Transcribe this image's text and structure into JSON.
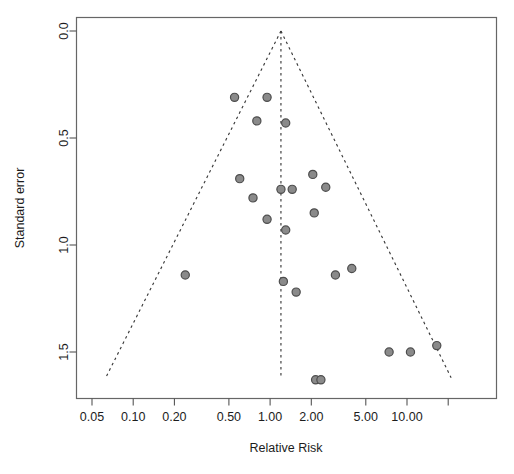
{
  "chart_data": {
    "type": "scatter",
    "title": "",
    "subtitle": "",
    "xlabel": "Relative Risk",
    "ylabel": "Standard error",
    "x_scale": "log",
    "xlim": [
      0.04,
      22.0
    ],
    "ylim": [
      0.0,
      1.62
    ],
    "y_inverted": true,
    "grid": false,
    "legend": "none",
    "x_ticks": [
      {
        "value": 0.05,
        "label": "0.05"
      },
      {
        "value": 0.1,
        "label": "0.10"
      },
      {
        "value": 0.2,
        "label": "0.20"
      },
      {
        "value": 0.5,
        "label": "0.50"
      },
      {
        "value": 1.0,
        "label": "1.00"
      },
      {
        "value": 2.0,
        "label": "2.00"
      },
      {
        "value": 5.0,
        "label": "5.00"
      },
      {
        "value": 10.0,
        "label": "10.00"
      },
      {
        "value": 20.0,
        "label": ""
      }
    ],
    "y_ticks": [
      {
        "value": 0.0,
        "label": "0.0"
      },
      {
        "value": 0.5,
        "label": "0.5"
      },
      {
        "value": 1.0,
        "label": "1.0"
      },
      {
        "value": 1.5,
        "label": "1.5"
      }
    ],
    "reference_line": {
      "x": 1.2,
      "style": "dashed"
    },
    "funnel": {
      "apex_x": 1.2,
      "apex_y": 0.0,
      "style": "dashed",
      "left_base_x": 0.063,
      "right_base_x": 21.0,
      "base_y": 1.62
    },
    "points": [
      {
        "x": 0.55,
        "y": 0.31
      },
      {
        "x": 0.95,
        "y": 0.31
      },
      {
        "x": 0.8,
        "y": 0.42
      },
      {
        "x": 1.3,
        "y": 0.43
      },
      {
        "x": 0.6,
        "y": 0.69
      },
      {
        "x": 0.75,
        "y": 0.78
      },
      {
        "x": 0.95,
        "y": 0.88
      },
      {
        "x": 1.2,
        "y": 0.74
      },
      {
        "x": 1.45,
        "y": 0.74
      },
      {
        "x": 2.05,
        "y": 0.67
      },
      {
        "x": 2.55,
        "y": 0.73
      },
      {
        "x": 2.1,
        "y": 0.85
      },
      {
        "x": 1.3,
        "y": 0.93
      },
      {
        "x": 0.24,
        "y": 1.14
      },
      {
        "x": 1.25,
        "y": 1.17
      },
      {
        "x": 1.55,
        "y": 1.22
      },
      {
        "x": 3.0,
        "y": 1.14
      },
      {
        "x": 3.95,
        "y": 1.11
      },
      {
        "x": 7.4,
        "y": 1.5
      },
      {
        "x": 10.6,
        "y": 1.5
      },
      {
        "x": 16.5,
        "y": 1.47
      },
      {
        "x": 2.15,
        "y": 1.63
      },
      {
        "x": 2.35,
        "y": 1.63
      }
    ]
  }
}
